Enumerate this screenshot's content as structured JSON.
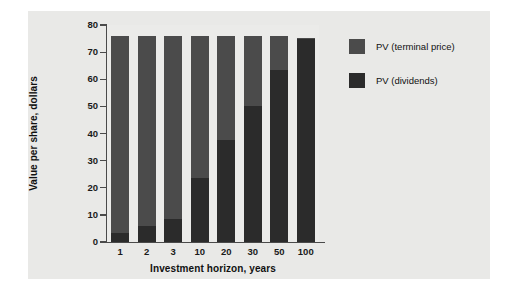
{
  "chart_data": {
    "type": "bar",
    "subtype": "stacked-bar",
    "title": "",
    "xlabel": "Investment horizon, years",
    "ylabel": "Value per share, dollars",
    "categories": [
      "1",
      "2",
      "3",
      "10",
      "20",
      "30",
      "50",
      "100"
    ],
    "ylim": [
      0,
      80
    ],
    "yticks": [
      0,
      10,
      20,
      30,
      40,
      50,
      60,
      70,
      80
    ],
    "ytick_labels": [
      "0",
      "10",
      "20",
      "30",
      "40",
      "50",
      "60",
      "70",
      "80"
    ],
    "grid": false,
    "legend_position": "right",
    "series": [
      {
        "name": "PV (dividends)",
        "color": "#2b2b2b",
        "values": [
          3.3,
          5.9,
          8.5,
          23.5,
          37.6,
          50.0,
          63.5,
          75.0
        ]
      },
      {
        "name": "PV (terminal price)",
        "color": "#4b4b4b",
        "values": [
          72.7,
          70.1,
          67.5,
          52.5,
          38.4,
          26.0,
          12.5,
          0.3
        ]
      }
    ],
    "totals": [
      76.0,
      76.0,
      76.0,
      76.0,
      76.0,
      76.0,
      76.0,
      75.3
    ]
  },
  "legend": {
    "items": [
      {
        "label": "PV (terminal price)",
        "color": "#4b4b4b"
      },
      {
        "label": "PV (dividends)",
        "color": "#2b2b2b"
      }
    ]
  },
  "colors": {
    "panel_background": "#e9e9e7",
    "plot_background": "#ebebe9",
    "axis": "#4a4a4a",
    "text": "#111111",
    "terminal_price": "#4b4b4b",
    "dividends": "#2b2b2b"
  }
}
